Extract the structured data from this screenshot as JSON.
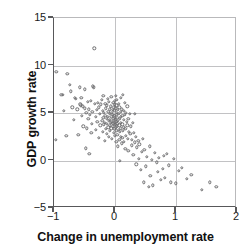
{
  "chart_data": {
    "type": "scatter",
    "title": "",
    "xlabel": "Change in unemployment rate",
    "ylabel": "GDP growth rate",
    "xlim": [
      -1,
      2
    ],
    "ylim": [
      -5,
      15
    ],
    "xticks": [
      -1,
      0,
      1,
      2
    ],
    "yticks": [
      -5,
      0,
      5,
      10,
      15
    ],
    "xtick_labels": [
      "−1",
      "0",
      "1",
      "2"
    ],
    "ytick_labels": [
      "−5",
      "0",
      "5",
      "10",
      "15"
    ],
    "grid": true,
    "gridlines_x": [
      0,
      1
    ],
    "gridlines_y": [
      0,
      5,
      10
    ],
    "legend": null,
    "marker": "open-circle",
    "marker_color": "#6e6e70",
    "axis_color": "#58585a",
    "grid_color": "#c2c2c4",
    "n_points": 208,
    "correlation": "strong negative (Okun's law)",
    "points": [
      [
        -0.96,
        9.3
      ],
      [
        -0.97,
        2.2
      ],
      [
        -0.88,
        6.9
      ],
      [
        -0.86,
        6.9
      ],
      [
        -0.84,
        5.2
      ],
      [
        -0.8,
        2.6
      ],
      [
        -0.78,
        9.1
      ],
      [
        -0.74,
        8.0
      ],
      [
        -0.72,
        7.3
      ],
      [
        -0.7,
        5.6
      ],
      [
        -0.68,
        4.3
      ],
      [
        -0.66,
        6.6
      ],
      [
        -0.64,
        6.5
      ],
      [
        -0.62,
        5.4
      ],
      [
        -0.6,
        2.7
      ],
      [
        -0.58,
        7.7
      ],
      [
        -0.57,
        5.9
      ],
      [
        -0.56,
        5.8
      ],
      [
        -0.55,
        6.6
      ],
      [
        -0.54,
        4.7
      ],
      [
        -0.53,
        5.7
      ],
      [
        -0.52,
        3.6
      ],
      [
        -0.5,
        5.5
      ],
      [
        -0.49,
        7.5
      ],
      [
        -0.48,
        1.3
      ],
      [
        -0.47,
        5.0
      ],
      [
        -0.46,
        3.4
      ],
      [
        -0.45,
        6.2
      ],
      [
        -0.44,
        4.4
      ],
      [
        -0.43,
        5.4
      ],
      [
        -0.42,
        0.7
      ],
      [
        -0.41,
        4.8
      ],
      [
        -0.4,
        6.3
      ],
      [
        -0.39,
        2.9
      ],
      [
        -0.38,
        3.9
      ],
      [
        -0.37,
        5.1
      ],
      [
        -0.36,
        7.8
      ],
      [
        -0.35,
        7.7
      ],
      [
        -0.34,
        11.8
      ],
      [
        -0.33,
        6.0
      ],
      [
        -0.32,
        4.6
      ],
      [
        -0.31,
        3.2
      ],
      [
        -0.3,
        5.3
      ],
      [
        -0.29,
        4.1
      ],
      [
        -0.28,
        6.1
      ],
      [
        -0.27,
        2.4
      ],
      [
        -0.26,
        5.6
      ],
      [
        -0.25,
        4.9
      ],
      [
        -0.24,
        3.7
      ],
      [
        -0.23,
        5.9
      ],
      [
        -0.22,
        6.4
      ],
      [
        -0.21,
        4.2
      ],
      [
        -0.2,
        3.0
      ],
      [
        -0.2,
        5.2
      ],
      [
        -0.19,
        4.5
      ],
      [
        -0.19,
        6.8
      ],
      [
        -0.18,
        3.8
      ],
      [
        -0.18,
        5.0
      ],
      [
        -0.17,
        4.0
      ],
      [
        -0.17,
        2.1
      ],
      [
        -0.16,
        6.0
      ],
      [
        -0.16,
        4.7
      ],
      [
        -0.15,
        3.3
      ],
      [
        -0.15,
        5.5
      ],
      [
        -0.14,
        4.4
      ],
      [
        -0.14,
        2.8
      ],
      [
        -0.13,
        5.8
      ],
      [
        -0.13,
        3.9
      ],
      [
        -0.12,
        4.6
      ],
      [
        -0.12,
        6.5
      ],
      [
        -0.11,
        3.5
      ],
      [
        -0.11,
        5.1
      ],
      [
        -0.1,
        4.2
      ],
      [
        -0.1,
        2.5
      ],
      [
        -0.1,
        6.2
      ],
      [
        -0.09,
        3.7
      ],
      [
        -0.09,
        4.9
      ],
      [
        -0.08,
        5.4
      ],
      [
        -0.08,
        3.1
      ],
      [
        -0.08,
        4.3
      ],
      [
        -0.07,
        5.7
      ],
      [
        -0.07,
        4.0
      ],
      [
        -0.06,
        6.7
      ],
      [
        -0.06,
        3.4
      ],
      [
        -0.06,
        4.6
      ],
      [
        -0.05,
        5.0
      ],
      [
        -0.05,
        2.3
      ],
      [
        -0.05,
        4.1
      ],
      [
        -0.04,
        3.6
      ],
      [
        -0.04,
        5.3
      ],
      [
        -0.04,
        4.8
      ],
      [
        -0.03,
        6.1
      ],
      [
        -0.03,
        3.9
      ],
      [
        -0.03,
        4.4
      ],
      [
        -0.02,
        5.6
      ],
      [
        -0.02,
        2.9
      ],
      [
        -0.02,
        4.2
      ],
      [
        -0.01,
        3.3
      ],
      [
        -0.01,
        5.2
      ],
      [
        -0.01,
        4.7
      ],
      [
        0.0,
        6.3
      ],
      [
        0.0,
        3.8
      ],
      [
        0.0,
        4.5
      ],
      [
        0.0,
        5.9
      ],
      [
        0.0,
        2.6
      ],
      [
        0.0,
        4.0
      ],
      [
        0.01,
        3.5
      ],
      [
        0.01,
        5.5
      ],
      [
        0.01,
        4.3
      ],
      [
        0.01,
        6.8
      ],
      [
        0.02,
        3.1
      ],
      [
        0.02,
        4.8
      ],
      [
        0.02,
        5.8
      ],
      [
        0.02,
        2.0
      ],
      [
        0.03,
        4.1
      ],
      [
        0.03,
        3.6
      ],
      [
        0.03,
        5.0
      ],
      [
        0.03,
        6.4
      ],
      [
        0.04,
        4.5
      ],
      [
        0.04,
        2.7
      ],
      [
        0.04,
        3.9
      ],
      [
        0.05,
        5.3
      ],
      [
        0.05,
        4.2
      ],
      [
        0.05,
        1.5
      ],
      [
        0.06,
        3.2
      ],
      [
        0.06,
        4.9
      ],
      [
        0.06,
        6.0
      ],
      [
        0.07,
        3.7
      ],
      [
        0.07,
        2.2
      ],
      [
        0.07,
        5.6
      ],
      [
        0.08,
        4.4
      ],
      [
        0.08,
        3.0
      ],
      [
        0.08,
        0.0
      ],
      [
        0.09,
        4.6
      ],
      [
        0.09,
        2.5
      ],
      [
        0.09,
        5.1
      ],
      [
        0.1,
        3.4
      ],
      [
        0.1,
        6.6
      ],
      [
        0.1,
        4.0
      ],
      [
        0.11,
        1.8
      ],
      [
        0.11,
        5.4
      ],
      [
        0.12,
        3.8
      ],
      [
        0.12,
        2.4
      ],
      [
        0.12,
        4.7
      ],
      [
        0.13,
        6.9
      ],
      [
        0.13,
        3.1
      ],
      [
        0.14,
        5.2
      ],
      [
        0.14,
        4.3
      ],
      [
        0.15,
        2.0
      ],
      [
        0.15,
        3.5
      ],
      [
        0.16,
        6.1
      ],
      [
        0.16,
        4.8
      ],
      [
        0.17,
        1.2
      ],
      [
        0.17,
        3.3
      ],
      [
        0.18,
        5.0
      ],
      [
        0.18,
        2.6
      ],
      [
        0.19,
        4.1
      ],
      [
        0.2,
        3.7
      ],
      [
        0.2,
        5.7
      ],
      [
        0.21,
        2.3
      ],
      [
        0.22,
        4.4
      ],
      [
        0.22,
        1.0
      ],
      [
        0.23,
        3.0
      ],
      [
        0.24,
        4.9
      ],
      [
        0.25,
        2.8
      ],
      [
        0.26,
        3.6
      ],
      [
        0.27,
        1.6
      ],
      [
        0.28,
        2.2
      ],
      [
        0.29,
        4.0
      ],
      [
        0.3,
        0.6
      ],
      [
        0.31,
        2.9
      ],
      [
        0.32,
        1.9
      ],
      [
        0.33,
        4.9
      ],
      [
        0.34,
        2.5
      ],
      [
        0.35,
        -0.4
      ],
      [
        0.36,
        1.4
      ],
      [
        0.38,
        2.1
      ],
      [
        0.39,
        0.2
      ],
      [
        0.4,
        1.7
      ],
      [
        0.42,
        -1.0
      ],
      [
        0.44,
        0.9
      ],
      [
        0.45,
        2.3
      ],
      [
        0.47,
        -2.3
      ],
      [
        0.48,
        1.1
      ],
      [
        0.5,
        -0.6
      ],
      [
        0.52,
        0.4
      ],
      [
        0.55,
        -2.8
      ],
      [
        0.57,
        1.5
      ],
      [
        0.58,
        -1.6
      ],
      [
        0.6,
        0.1
      ],
      [
        0.62,
        -2.6
      ],
      [
        0.65,
        0.8
      ],
      [
        0.68,
        -0.2
      ],
      [
        0.7,
        -1.2
      ],
      [
        0.72,
        0.3
      ],
      [
        0.75,
        -2.0
      ],
      [
        0.78,
        -0.9
      ],
      [
        0.8,
        0.5
      ],
      [
        0.82,
        -1.8
      ],
      [
        0.85,
        0.7
      ],
      [
        0.88,
        -0.5
      ],
      [
        0.92,
        -2.3
      ],
      [
        0.96,
        0.2
      ],
      [
        1.0,
        -2.4
      ],
      [
        1.05,
        -1.1
      ],
      [
        1.1,
        -0.8
      ],
      [
        1.18,
        -1.9
      ],
      [
        1.25,
        -1.5
      ],
      [
        1.42,
        -3.1
      ],
      [
        1.55,
        -2.3
      ],
      [
        1.66,
        -2.8
      ]
    ]
  }
}
